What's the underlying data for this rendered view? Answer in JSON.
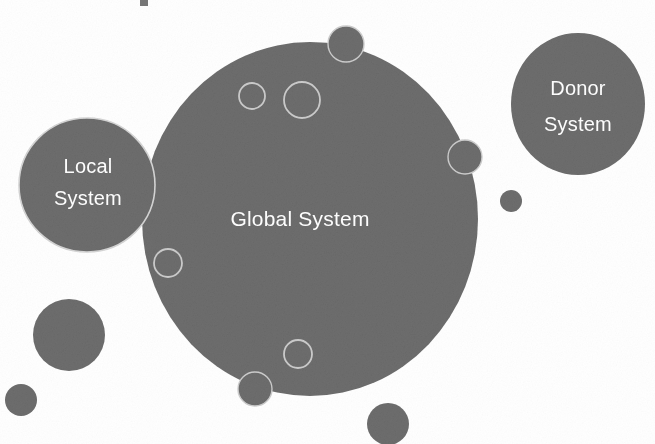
{
  "diagram": {
    "type": "venn-bubble-diagram",
    "background_color": "#ffffff",
    "fill_color": "#6e6e6e",
    "outline_color": "#c8c8c8",
    "label_color": "#ffffff",
    "width": 655,
    "height": 444,
    "labels": {
      "global": "Global System",
      "local_line1": "Local",
      "local_line2": "System",
      "donor_line1": "Donor",
      "donor_line2": "System"
    },
    "shapes": {
      "global_system": {
        "cx": 310,
        "cy": 219,
        "rx": 168,
        "ry": 177,
        "style": "filled"
      },
      "local_system": {
        "cx": 87,
        "cy": 185,
        "rx": 68,
        "ry": 67,
        "style": "filled"
      },
      "donor_system": {
        "cx": 578,
        "cy": 104,
        "rx": 67,
        "ry": 71,
        "style": "filled"
      },
      "hollow_small_top_left": {
        "cx": 252,
        "cy": 96,
        "r": 13,
        "style": "outline"
      },
      "hollow_large_top_mid": {
        "cx": 302,
        "cy": 100,
        "r": 18,
        "style": "outline"
      },
      "hollow_mid_left": {
        "cx": 168,
        "cy": 263,
        "r": 14,
        "style": "outline"
      },
      "hollow_lower_mid": {
        "cx": 298,
        "cy": 354,
        "r": 14,
        "style": "outline"
      },
      "filled_top_edge": {
        "cx": 346,
        "cy": 44,
        "r": 18,
        "style": "filled-ring"
      },
      "filled_right_edge": {
        "cx": 465,
        "cy": 157,
        "r": 17,
        "style": "filled-ring"
      },
      "filled_bottom_edge": {
        "cx": 255,
        "cy": 389,
        "r": 17,
        "style": "filled-ring"
      },
      "filled_free_right": {
        "cx": 511,
        "cy": 201,
        "r": 11,
        "style": "filled"
      },
      "filled_free_lower_left": {
        "cx": 69,
        "cy": 335,
        "r": 36,
        "style": "filled"
      },
      "filled_free_small_left": {
        "cx": 21,
        "cy": 400,
        "r": 16,
        "style": "filled"
      },
      "filled_free_bottom": {
        "cx": 388,
        "cy": 424,
        "r": 21,
        "style": "filled"
      }
    },
    "artifact_mark": {
      "x": 140,
      "y": 0,
      "w": 8,
      "h": 6
    }
  }
}
